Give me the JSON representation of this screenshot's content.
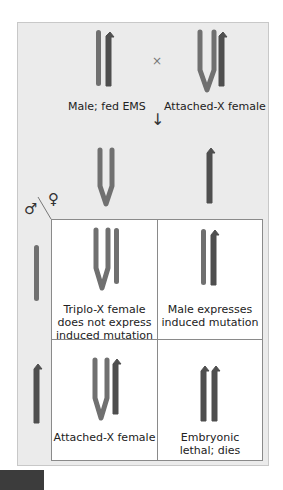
{
  "colors": {
    "panel": "#ebebeb",
    "chrom_light": "#6e6e6e",
    "chrom_dark": "#4f4f4f",
    "grid_line": "#8a8a8a"
  },
  "parents": {
    "male_label": "Male; fed EMS",
    "cross_symbol": "×",
    "female_label": "Attached-X female"
  },
  "gametes_arrow": "↓",
  "punnett": {
    "male_symbol": "♂",
    "female_symbol": "♀",
    "cells": [
      {
        "label": "Triplo-X female does not express induced mutation"
      },
      {
        "label": "Male expresses induced mutation"
      },
      {
        "label": "Attached-X female"
      },
      {
        "label": "Embryonic lethal; dies"
      }
    ],
    "cell_lines": [
      [
        "Triplo-X female",
        "does not express",
        "induced mutation"
      ],
      [
        "Male expresses",
        "induced mutation"
      ],
      [
        "Attached-X female"
      ],
      [
        "Embryonic",
        "lethal; dies"
      ]
    ]
  }
}
